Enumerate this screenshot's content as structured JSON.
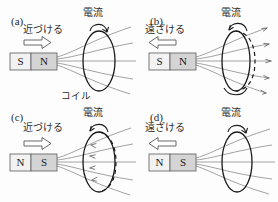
{
  "figure": {
    "coil_caption": "コイル",
    "colors": {
      "ink": "#1a1a1a",
      "field_line": "#8a8a8a",
      "coil_stroke": "#1a1a1a",
      "magnet_south_fill": "#f2f2f2",
      "magnet_north_fill": "#d4d4d4",
      "background": "#ffffff"
    }
  },
  "panels": [
    {
      "id": "(a)",
      "motion_label": "近づける",
      "motion_direction": "right",
      "current_label": "電流",
      "current_rotation": "clockwise-front",
      "magnet": {
        "left_pole": "S",
        "right_pole": "N",
        "shaded": "right"
      },
      "field_arrow_direction": "right",
      "field_arrows_visible": false
    },
    {
      "id": "(b)",
      "motion_label": "遠ざける",
      "motion_direction": "left",
      "current_label": "電流",
      "current_rotation": "counterclockwise-front",
      "magnet": {
        "left_pole": "S",
        "right_pole": "N",
        "shaded": "right"
      },
      "field_arrow_direction": "right",
      "field_arrows_visible": true
    },
    {
      "id": "(c)",
      "motion_label": "近づける",
      "motion_direction": "right",
      "current_label": "電流",
      "current_rotation": "counterclockwise-front",
      "magnet": {
        "left_pole": "N",
        "right_pole": "S",
        "shaded": "right"
      },
      "field_arrow_direction": "left",
      "field_arrows_visible": true
    },
    {
      "id": "(d)",
      "motion_label": "遠ざける",
      "motion_direction": "left",
      "current_label": "電流",
      "current_rotation": "clockwise-front",
      "magnet": {
        "left_pole": "N",
        "right_pole": "S",
        "shaded": "right"
      },
      "field_arrow_direction": "right",
      "field_arrows_visible": false
    }
  ]
}
